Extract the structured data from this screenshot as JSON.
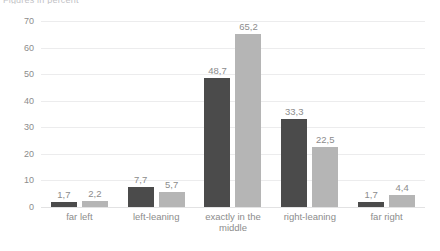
{
  "chart_data": {
    "type": "bar",
    "title": "Figures in percent",
    "categories": [
      "far left",
      "left-leaning",
      "exactly in the\nmiddle",
      "right-leaning",
      "far right"
    ],
    "series": [
      {
        "name": "series-1",
        "color": "#4b4b4b",
        "values": [
          1.7,
          7.7,
          48.7,
          33.3,
          1.7
        ],
        "labels": [
          "1,7",
          "7,7",
          "48,7",
          "33,3",
          "1,7"
        ]
      },
      {
        "name": "series-2",
        "color": "#b5b5b5",
        "values": [
          2.2,
          5.7,
          65.2,
          22.5,
          4.4
        ],
        "labels": [
          "2,2",
          "5,7",
          "65,2",
          "22,5",
          "4,4"
        ]
      }
    ],
    "xlabel": "",
    "ylabel": "",
    "ylim": [
      0,
      70
    ],
    "yticks": [
      0,
      10,
      20,
      30,
      40,
      50,
      60,
      70
    ],
    "ytick_labels": [
      "0",
      "10",
      "20",
      "30",
      "40",
      "50",
      "60",
      "70"
    ],
    "grid": true,
    "legend": "none",
    "gridline_color": "#ececed"
  }
}
